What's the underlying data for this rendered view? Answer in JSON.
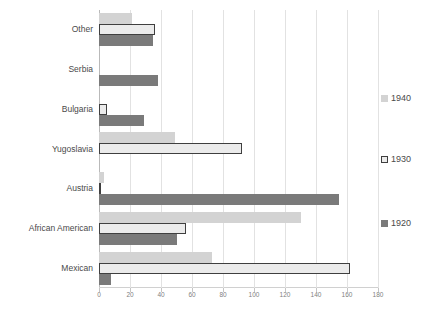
{
  "chart_data": {
    "type": "bar",
    "orientation": "horizontal",
    "title": "",
    "xlabel": "",
    "ylabel": "",
    "xlim": [
      0,
      180
    ],
    "xticks": [
      0,
      20,
      40,
      60,
      80,
      100,
      120,
      140,
      160,
      180
    ],
    "xtick_labels": [
      "0",
      "20",
      "40",
      "60",
      "80",
      "100",
      "120",
      "140",
      "160",
      "180"
    ],
    "grid": "vertical",
    "legend_position": "right",
    "categories": [
      "Other",
      "Serbia",
      "Bulgaria",
      "Yugoslavia",
      "Austria",
      "African American",
      "Mexican"
    ],
    "series": [
      {
        "name": "1940",
        "color": "#d3d3d3",
        "values": [
          21,
          0,
          0,
          49,
          3,
          130,
          73
        ]
      },
      {
        "name": "1930",
        "color": "#ebebeb",
        "border_color": "#3f3f3f",
        "values": [
          36,
          0,
          5,
          92,
          1,
          56,
          162
        ]
      },
      {
        "name": "1920",
        "color": "#7a7a7a",
        "values": [
          35,
          38,
          29,
          0,
          155,
          50,
          8
        ]
      }
    ]
  },
  "legend": {
    "items": [
      {
        "label": "1940",
        "swatch": "legend-swatch-1940"
      },
      {
        "label": "1930",
        "swatch": "legend-swatch-1930"
      },
      {
        "label": "1920",
        "swatch": "legend-swatch-1920"
      }
    ]
  },
  "colors": {
    "series_1940": "#d3d3d3",
    "series_1930": "#ebebeb",
    "series_1930_border": "#3f3f3f",
    "series_1920": "#7a7a7a",
    "gridline": "#e2e2e2",
    "axis": "#b9b9b9",
    "label_text": "#4a4a4a",
    "tick_text": "#808080",
    "background": "#ffffff"
  }
}
